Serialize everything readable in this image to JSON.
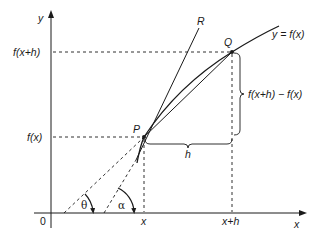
{
  "diagram": {
    "type": "derivative-secant-tangent",
    "axes": {
      "x_label": "x",
      "y_label": "y",
      "origin_label": "0"
    },
    "curve_label": "y = f(x)",
    "points": {
      "P": "P",
      "Q": "Q",
      "R": "R"
    },
    "y_ticks": {
      "upper": "f(x+h)",
      "lower": "f(x)"
    },
    "x_ticks": {
      "left": "x",
      "right": "x+h"
    },
    "braces": {
      "vertical": "f(x+h) − f(x)",
      "horizontal": "h"
    },
    "angles": {
      "secant_angle": "θ",
      "tangent_angle": "α"
    },
    "colors": {
      "ink": "#1a1a1a",
      "background": "#ffffff"
    }
  }
}
